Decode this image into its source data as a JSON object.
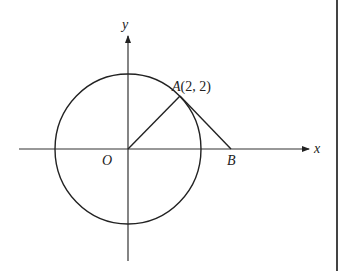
{
  "diagram": {
    "type": "coordinate-geometry",
    "axes": {
      "x_label": "x",
      "y_label": "y"
    },
    "origin_label": "O",
    "circle": {
      "center": "O",
      "passes_through": "A"
    },
    "points": [
      {
        "name": "A",
        "coords": "(2, 2)",
        "label": "A(2, 2)"
      },
      {
        "name": "B",
        "label": "B"
      }
    ],
    "segments": [
      "OA",
      "AB"
    ],
    "labels": {
      "A_letter": "A",
      "A_coords": "(2, 2)",
      "B": "B",
      "O": "O",
      "x": "x",
      "y": "y"
    }
  }
}
